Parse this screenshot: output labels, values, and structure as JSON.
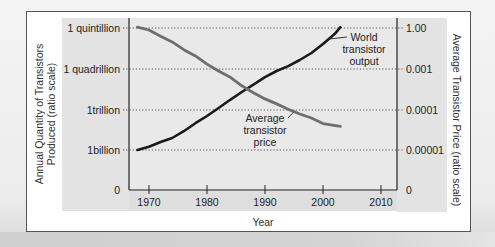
{
  "chart_data": {
    "type": "line",
    "title": "",
    "xlabel": "Year",
    "ylabel_left": [
      "Annual Quantity of Transistors",
      "Produced (ratio scale)"
    ],
    "ylabel_right": "Average Transistor Price (ratio scale)",
    "x_ticks": [
      1970,
      1980,
      1990,
      2000,
      2010
    ],
    "xlim": [
      1966.5,
      2013
    ],
    "left_ticks": [
      "0",
      "1billion",
      "1trillion",
      "1 quadrillion",
      "1 quintillion"
    ],
    "right_ticks": [
      "0",
      "0.00001",
      "0.0001",
      "0.001",
      "1.00"
    ],
    "y_scale": "ratio (log), gridline levels 0-4",
    "grid": "horizontal dotted at each labeled level",
    "series": [
      {
        "name": "World transistor output",
        "axis": "left",
        "color": "#1a1a1a",
        "x": [
          1968,
          1970,
          1972,
          1974,
          1976,
          1978,
          1980,
          1982,
          1984,
          1986,
          1988,
          1990,
          1992,
          1994,
          1996,
          1998,
          2000,
          2002,
          2003
        ],
        "level": [
          1.0,
          1.08,
          1.2,
          1.3,
          1.47,
          1.67,
          1.85,
          2.05,
          2.25,
          2.44,
          2.62,
          2.8,
          2.95,
          3.07,
          3.22,
          3.39,
          3.61,
          3.85,
          4.02
        ]
      },
      {
        "name": "Average transistor price",
        "axis": "right",
        "color": "#6e6e6e",
        "x": [
          1968,
          1970,
          1972,
          1974,
          1976,
          1978,
          1980,
          1982,
          1984,
          1986,
          1988,
          1990,
          1992,
          1994,
          1996,
          1998,
          2000,
          2003
        ],
        "level": [
          4.02,
          3.95,
          3.8,
          3.66,
          3.47,
          3.32,
          3.12,
          2.95,
          2.8,
          2.59,
          2.42,
          2.27,
          2.15,
          2.02,
          1.9,
          1.8,
          1.66,
          1.59
        ]
      }
    ],
    "annotations": [
      {
        "lines": [
          "World",
          "transistor",
          "output"
        ],
        "series": "World transistor output",
        "leader_x": 2001
      },
      {
        "lines": [
          "Average",
          "transistor",
          "price"
        ],
        "series": "Average transistor price",
        "leader_x": 1995
      }
    ]
  }
}
